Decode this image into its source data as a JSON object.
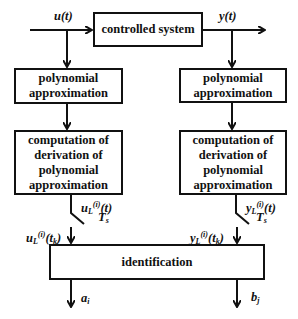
{
  "diagram": {
    "type": "block-diagram",
    "blocks": {
      "controlled_system": "controlled system",
      "poly_left": "polynomial\napproximation",
      "poly_right": "polynomial\napproximation",
      "deriv_left": "computation of\nderivation of\npolynomial\napproximation",
      "deriv_right": "computation of\nderivation of\npolynomial\napproximation",
      "identification": "identification"
    },
    "signals": {
      "input": {
        "base": "u(t)"
      },
      "output": {
        "base": "y(t)"
      },
      "u_deriv": {
        "main": "u",
        "sub": "L",
        "sup": "(i)",
        "arg": "(t)"
      },
      "y_deriv": {
        "main": "y",
        "sub": "L",
        "sup": "(i)",
        "arg": "(t)"
      },
      "sampling_left": {
        "main": "T",
        "sub": "s"
      },
      "sampling_right": {
        "main": "T",
        "sub": "s"
      },
      "u_sampled": {
        "main": "u",
        "sub": "L",
        "sup": "(i)",
        "arg_main": "(t",
        "arg_sub": "k",
        "arg_end": ")"
      },
      "y_sampled": {
        "main": "y",
        "sub": "L",
        "sup": "(i)",
        "arg_main": "(t",
        "arg_sub": "k",
        "arg_end": ")"
      },
      "out_a": {
        "main": "a",
        "sub": "i"
      },
      "out_b": {
        "main": "b",
        "sub": "j"
      }
    },
    "colors": {
      "line": "#111111",
      "background": "#ffffff"
    }
  }
}
